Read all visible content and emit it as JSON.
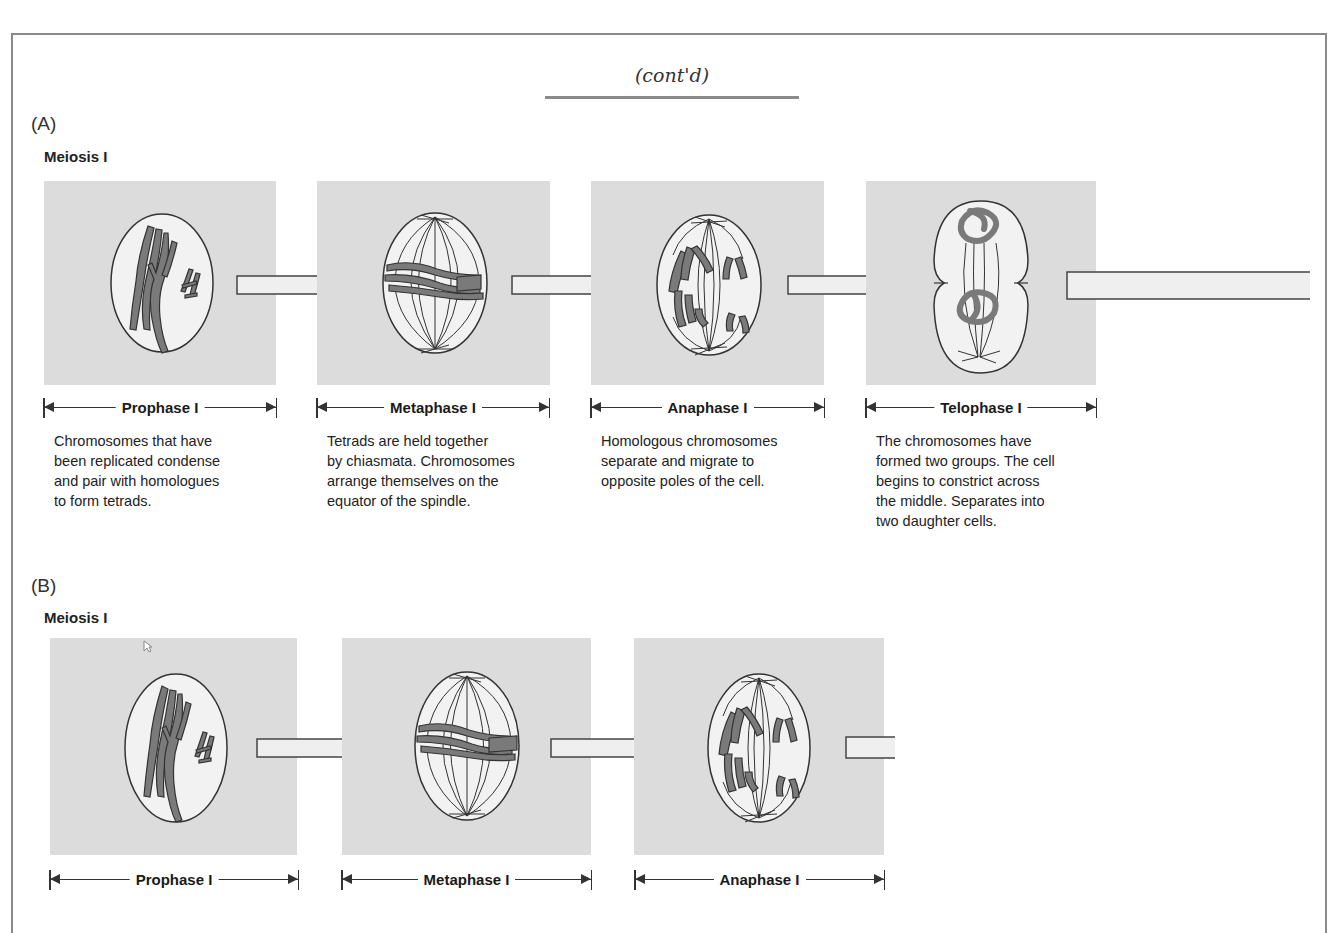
{
  "header": {
    "title": "(cont'd)"
  },
  "sections": [
    {
      "letter": "(A)",
      "title": "Meiosis I",
      "phases": [
        {
          "name": "Prophase I",
          "description_lines": [
            "Chromosomes that have",
            "been replicated condense",
            "and pair with homologues",
            "to form tetrads."
          ],
          "illustration": "prophase-cell"
        },
        {
          "name": "Metaphase I",
          "description_lines": [
            "Tetrads are held together",
            "by chiasmata. Chromosomes",
            "arrange themselves on the",
            "equator of the spindle."
          ],
          "illustration": "metaphase-cell"
        },
        {
          "name": "Anaphase I",
          "description_lines": [
            "Homologous chromosomes",
            "separate and migrate to",
            "opposite poles of the cell."
          ],
          "illustration": "anaphase-cell"
        },
        {
          "name": "Telophase I",
          "description_lines": [
            "The chromosomes have",
            "formed two groups. The cell",
            "begins to constrict across",
            "the middle. Separates into",
            "two daughter cells."
          ],
          "illustration": "telophase-cell"
        }
      ]
    },
    {
      "letter": "(B)",
      "title": "Meiosis I",
      "phases": [
        {
          "name": "Prophase I",
          "illustration": "prophase-cell"
        },
        {
          "name": "Metaphase I",
          "illustration": "metaphase-cell"
        },
        {
          "name": "Anaphase I",
          "illustration": "anaphase-cell"
        }
      ]
    }
  ],
  "colors": {
    "panel_bg": "#dcdcdc",
    "cell_fill": "#f2f2f2",
    "chromosome": "#7a7a7a",
    "outline": "#333333",
    "frame": "#8a8a8a"
  }
}
